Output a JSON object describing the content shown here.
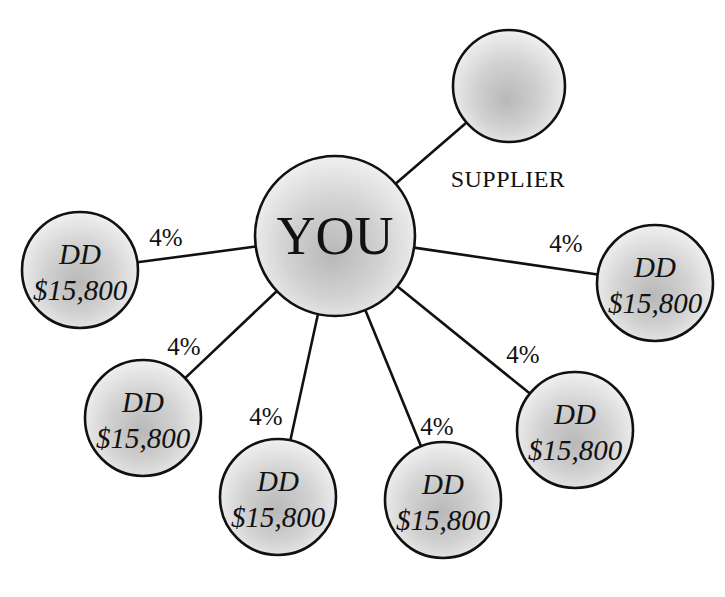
{
  "diagram": {
    "center": {
      "label": "YOU",
      "cx": 335,
      "cy": 236,
      "r": 80
    },
    "supplier": {
      "label": "SUPPLIER",
      "cx": 509,
      "cy": 86,
      "r": 56,
      "label_x": 508,
      "label_y": 187
    },
    "dd_nodes": [
      {
        "line1": "DD",
        "line2": "$15,800",
        "cx": 80,
        "cy": 270,
        "r": 58,
        "percent": "4%",
        "pct_x": 166,
        "pct_y": 246,
        "edge_to": [
          252,
          241
        ]
      },
      {
        "line1": "DD",
        "line2": "$15,800",
        "cx": 655,
        "cy": 283,
        "r": 58,
        "percent": "4%",
        "pct_x": 566,
        "pct_y": 252,
        "edge_to": [
          415,
          243
        ]
      },
      {
        "line1": "DD",
        "line2": "$15,800",
        "cx": 143,
        "cy": 418,
        "r": 58,
        "percent": "4%",
        "pct_x": 184,
        "pct_y": 355,
        "edge_to": [
          280,
          294
        ]
      },
      {
        "line1": "DD",
        "line2": "$15,800",
        "cx": 278,
        "cy": 497,
        "r": 58,
        "percent": "4%",
        "pct_x": 266,
        "pct_y": 425,
        "edge_to": [
          317,
          314
        ]
      },
      {
        "line1": "DD",
        "line2": "$15,800",
        "cx": 443,
        "cy": 500,
        "r": 58,
        "percent": "4%",
        "pct_x": 437,
        "pct_y": 435,
        "edge_to": [
          368,
          310
        ]
      },
      {
        "line1": "DD",
        "line2": "$15,800",
        "cx": 575,
        "cy": 430,
        "r": 58,
        "percent": "4%",
        "pct_x": 523,
        "pct_y": 363,
        "edge_to": [
          398,
          287
        ]
      }
    ]
  },
  "colors": {
    "stroke": "#111111",
    "fill_light": "#eeeeee",
    "fill_dark": "#b5b5b5",
    "background": "#ffffff"
  }
}
